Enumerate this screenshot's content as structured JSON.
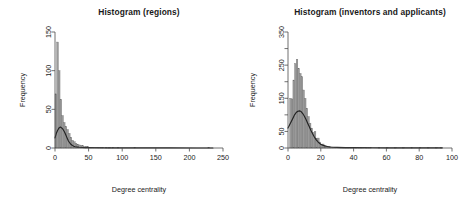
{
  "figure": {
    "background": "#ffffff",
    "bar_color": "#9a9a9a",
    "bar_edge_color": "#6e6e6e",
    "curve_color": "#222222",
    "axis_color": "#4d4d4d"
  },
  "chart_data": [
    {
      "type": "bar",
      "id": "histogram-regions",
      "title": "Histogram (regions)",
      "xlabel": "Degree centrality",
      "ylabel": "Frequency",
      "xlim": [
        0,
        250
      ],
      "ylim": [
        0,
        150
      ],
      "xticks": [
        0,
        50,
        100,
        150,
        200,
        250
      ],
      "xticklabels": [
        "0",
        "50",
        "100",
        "150",
        "200",
        "250"
      ],
      "yticks": [
        0,
        50,
        100,
        150
      ],
      "yticklabels": [
        "0",
        "50",
        "100",
        "150"
      ],
      "grid": false,
      "legend": "none",
      "bin_width": 2.5,
      "bin_starts": [
        0,
        2.5,
        5,
        7.5,
        10,
        12.5,
        15,
        17.5,
        20,
        22.5,
        25,
        27.5,
        30,
        32.5,
        35,
        37.5,
        40,
        42.5,
        45,
        47.5,
        50,
        52.5,
        55,
        57.5,
        60,
        62.5,
        65,
        67.5,
        70,
        72.5,
        75,
        77.5,
        80,
        82.5,
        85,
        87.5,
        90,
        92.5,
        95,
        97.5,
        100,
        102.5,
        105,
        107.5,
        110,
        112.5,
        115,
        117.5,
        120,
        122.5,
        125,
        127.5,
        130,
        132.5,
        135,
        137.5,
        140,
        142.5,
        145,
        147.5,
        150,
        152.5,
        155,
        157.5,
        160,
        162.5,
        165,
        167.5,
        170,
        172.5,
        175,
        177.5,
        180,
        182.5,
        185,
        187.5,
        190,
        192.5,
        195,
        197.5,
        200,
        202.5,
        205,
        207.5,
        210,
        212.5,
        215,
        217.5,
        220,
        222.5,
        225,
        227.5
      ],
      "values": [
        70,
        137,
        100,
        63,
        42,
        33,
        28,
        24,
        19,
        14,
        10,
        8,
        6,
        5,
        4,
        3,
        3,
        2,
        2,
        2,
        1,
        1,
        1,
        1,
        1,
        1,
        1,
        1,
        1,
        0,
        1,
        0,
        1,
        0,
        1,
        0,
        0,
        1,
        0,
        0,
        0,
        0,
        0,
        0,
        0,
        0,
        0,
        1,
        0,
        0,
        0,
        0,
        0,
        0,
        0,
        0,
        0,
        0,
        0,
        0,
        0,
        0,
        0,
        0,
        0,
        0,
        0,
        0,
        0,
        0,
        0,
        0,
        0,
        0,
        0,
        0,
        0,
        0,
        0,
        0,
        0,
        0,
        0,
        0,
        0,
        0,
        0,
        0,
        0,
        0,
        0,
        1
      ],
      "density_curve": {
        "name": "density estimate",
        "x": [
          0,
          2,
          4,
          6,
          8,
          10,
          12,
          14,
          16,
          18,
          20,
          22,
          24,
          26,
          28,
          30,
          32,
          34,
          36,
          40,
          45,
          50,
          60,
          80,
          100,
          130,
          170,
          210,
          235
        ],
        "y": [
          13,
          19,
          23,
          26,
          27,
          26,
          24,
          21,
          17,
          13,
          9,
          6.5,
          4.5,
          3.2,
          2.3,
          1.7,
          1.3,
          1.1,
          0.9,
          0.7,
          0.5,
          0.4,
          0.3,
          0.2,
          0.15,
          0.1,
          0.08,
          0.05,
          0.05
        ]
      }
    },
    {
      "type": "bar",
      "id": "histogram-inventors-applicants",
      "title": "Histogram (inventors and applicants)",
      "xlabel": "Degree centrality",
      "ylabel": "Frequency",
      "xlim": [
        0,
        100
      ],
      "ylim": [
        0,
        350
      ],
      "xticks": [
        0,
        20,
        40,
        60,
        80,
        100
      ],
      "xticklabels": [
        "0",
        "20",
        "40",
        "60",
        "80",
        "100"
      ],
      "yticks": [
        0,
        50,
        100,
        150,
        200,
        250,
        300,
        350
      ],
      "yticklabels": [
        "0",
        "50",
        "",
        "150",
        "",
        "250",
        "",
        "350"
      ],
      "grid": false,
      "legend": "none",
      "bin_width": 1,
      "bin_starts": [
        0,
        1,
        2,
        3,
        4,
        5,
        6,
        7,
        8,
        9,
        10,
        11,
        12,
        13,
        14,
        15,
        16,
        17,
        18,
        19,
        20,
        21,
        22,
        23,
        24,
        25,
        26,
        27,
        28,
        29,
        30,
        31,
        32,
        33,
        34,
        35,
        36,
        37,
        38,
        39,
        40,
        41,
        42,
        43,
        44,
        45,
        46,
        47,
        48,
        49,
        50,
        55,
        60,
        65,
        70,
        75,
        80,
        85,
        90,
        93
      ],
      "values": [
        0,
        150,
        148,
        205,
        255,
        268,
        240,
        225,
        215,
        175,
        150,
        120,
        95,
        75,
        60,
        47,
        50,
        28,
        30,
        18,
        10,
        12,
        6,
        5,
        4,
        3,
        3,
        2,
        2,
        2,
        2,
        1,
        1,
        1,
        1,
        1,
        1,
        1,
        1,
        1,
        2,
        1,
        2,
        1,
        1,
        1,
        2,
        1,
        1,
        1,
        1,
        1,
        1,
        1,
        1,
        1,
        1,
        1,
        1,
        1
      ],
      "density_curve": {
        "name": "density estimate",
        "x": [
          0,
          1,
          2,
          3,
          4,
          5,
          6,
          7,
          8,
          9,
          10,
          11,
          12,
          13,
          14,
          15,
          16,
          17,
          18,
          19,
          20,
          22,
          24,
          26,
          28,
          30,
          35,
          40,
          50,
          60,
          70,
          80,
          94
        ],
        "y": [
          60,
          70,
          80,
          90,
          100,
          107,
          111,
          112,
          110,
          104,
          96,
          86,
          75,
          64,
          53,
          43,
          34,
          26,
          20,
          15,
          11,
          7,
          4.5,
          3,
          2.2,
          1.8,
          1.2,
          1,
          0.7,
          0.5,
          0.4,
          0.3,
          0.25
        ]
      }
    }
  ]
}
